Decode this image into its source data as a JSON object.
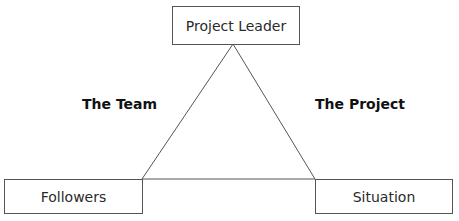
{
  "diagram": {
    "type": "triangle-relationship",
    "nodes": {
      "top": {
        "label": "Project Leader"
      },
      "bottom_left": {
        "label": "Followers"
      },
      "bottom_right": {
        "label": "Situation"
      }
    },
    "edge_labels": {
      "left": "The Team",
      "right": "The Project"
    },
    "colors": {
      "line": "#555555",
      "text": "#1a1a1a",
      "background": "#ffffff"
    }
  }
}
